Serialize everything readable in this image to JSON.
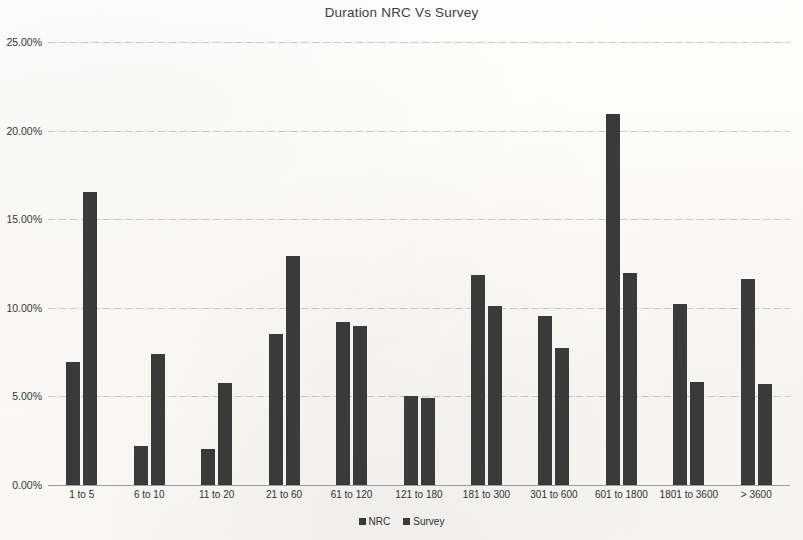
{
  "chart_data": {
    "type": "bar",
    "title": "Duration NRC Vs Survey",
    "xlabel": "",
    "ylabel": "",
    "ylim": [
      0,
      25
    ],
    "ytick_labels": [
      "0.00%",
      "5.00%",
      "10.00%",
      "15.00%",
      "20.00%",
      "25.00%"
    ],
    "ytick_values": [
      0,
      5,
      10,
      15,
      20,
      25
    ],
    "grid": true,
    "legend_position": "bottom",
    "categories": [
      "1 to 5",
      "6 to 10",
      "11 to 20",
      "21 to 60",
      "61 to 120",
      "121 to 180",
      "181 to 300",
      "301 to 600",
      "601 to 1800",
      "1801 to 3600",
      "> 3600"
    ],
    "series": [
      {
        "name": "NRC",
        "color": "#3a3a3a",
        "values": [
          6.95,
          2.2,
          2.05,
          8.5,
          9.2,
          5.05,
          11.85,
          9.55,
          20.95,
          10.2,
          11.65
        ]
      },
      {
        "name": "Survey",
        "color": "#3a3a3a",
        "values": [
          16.55,
          7.4,
          5.75,
          12.9,
          8.95,
          4.9,
          10.1,
          7.75,
          11.95,
          5.8,
          5.7
        ]
      }
    ]
  },
  "legend": {
    "entries": [
      {
        "label": "NRC"
      },
      {
        "label": "Survey"
      }
    ]
  },
  "colors": {
    "bar": "#3a3a3a",
    "background": "#fdfdfb",
    "gridline": "#969696",
    "text": "#2b2b2b"
  }
}
